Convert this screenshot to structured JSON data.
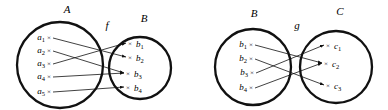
{
  "figure": {
    "type": "function-mapping-diagram",
    "style": {
      "stroke_color": "#111111",
      "background_color": "#ffffff",
      "circle_stroke_width": 2.2,
      "arrow_stroke_width": 0.8
    }
  },
  "diagrams": [
    {
      "id": "f-diagram",
      "map_label": "f",
      "domain": {
        "name": "A",
        "elements": [
          {
            "base": "a",
            "sub": "1",
            "text": "a₁"
          },
          {
            "base": "a",
            "sub": "2",
            "text": "a₂"
          },
          {
            "base": "a",
            "sub": "3",
            "text": "a₃"
          },
          {
            "base": "a",
            "sub": "4",
            "text": "a₄"
          },
          {
            "base": "a",
            "sub": "5",
            "text": "a₅"
          }
        ]
      },
      "codomain": {
        "name": "B",
        "elements": [
          {
            "base": "b",
            "sub": "1",
            "text": "b₁"
          },
          {
            "base": "b",
            "sub": "2",
            "text": "b₂"
          },
          {
            "base": "b",
            "sub": "3",
            "text": "b₃"
          },
          {
            "base": "b",
            "sub": "4",
            "text": "b₄"
          }
        ]
      },
      "mappings": [
        {
          "from": "a₁",
          "to": "b₂"
        },
        {
          "from": "a₂",
          "to": "b₃"
        },
        {
          "from": "a₃",
          "to": "b₁"
        },
        {
          "from": "a₄",
          "to": "b₃"
        },
        {
          "from": "a₅",
          "to": "b₄"
        }
      ]
    },
    {
      "id": "g-diagram",
      "map_label": "g",
      "domain": {
        "name": "B",
        "elements": [
          {
            "base": "b",
            "sub": "1",
            "text": "b₁"
          },
          {
            "base": "b",
            "sub": "2",
            "text": "b₂"
          },
          {
            "base": "b",
            "sub": "3",
            "text": "b₃"
          },
          {
            "base": "b",
            "sub": "4",
            "text": "b₄"
          }
        ]
      },
      "codomain": {
        "name": "C",
        "elements": [
          {
            "base": "c",
            "sub": "1",
            "text": "c₁"
          },
          {
            "base": "c",
            "sub": "2",
            "text": "c₂"
          },
          {
            "base": "c",
            "sub": "3",
            "text": "c₃"
          }
        ]
      },
      "mappings": [
        {
          "from": "b₁",
          "to": "c₂"
        },
        {
          "from": "b₂",
          "to": "c₃"
        },
        {
          "from": "b₃",
          "to": "c₁"
        },
        {
          "from": "b₄",
          "to": "c₂"
        }
      ]
    }
  ],
  "marks": {
    "point_glyph": "×"
  }
}
